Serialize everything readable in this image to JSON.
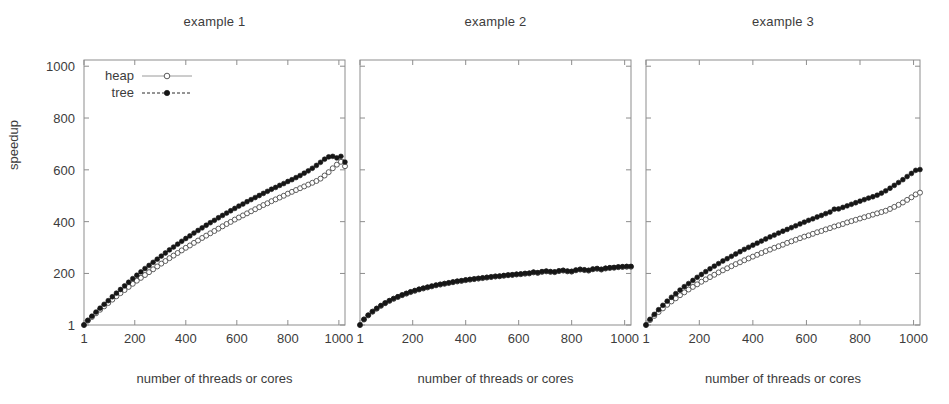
{
  "figure": {
    "ylabel": "speedup",
    "legend": [
      {
        "label": "heap",
        "marker": "open-circle",
        "line": "solid",
        "color": "#4a4a4a"
      },
      {
        "label": "tree",
        "marker": "filled-circle",
        "line": "dashed",
        "color": "#161616"
      }
    ]
  },
  "panels": [
    {
      "title": "example 1",
      "xlabel": "number of threads or cores"
    },
    {
      "title": "example 2",
      "xlabel": "number of threads or cores"
    },
    {
      "title": "example 3",
      "xlabel": "number of threads or cores"
    }
  ],
  "axis": {
    "xticks": [
      "1",
      "200",
      "400",
      "600",
      "800",
      "1000"
    ],
    "xtick_values": [
      1,
      200,
      400,
      600,
      800,
      1000
    ],
    "yticks": [
      "1",
      "200",
      "400",
      "600",
      "800",
      "1000"
    ],
    "ytick_values": [
      1,
      200,
      400,
      600,
      800,
      1000
    ],
    "xlim": [
      1,
      1024
    ],
    "ylim": [
      1,
      1024
    ]
  },
  "chart_data": [
    {
      "type": "line",
      "title": "example 1",
      "xlabel": "number of threads or cores",
      "ylabel": "speedup",
      "xlim": [
        1,
        1024
      ],
      "ylim": [
        1,
        1024
      ],
      "grid": false,
      "legend_position": "top-left",
      "x": [
        1,
        16,
        32,
        48,
        64,
        80,
        96,
        112,
        128,
        144,
        160,
        176,
        192,
        208,
        224,
        240,
        256,
        272,
        288,
        304,
        320,
        336,
        352,
        368,
        384,
        400,
        416,
        432,
        448,
        464,
        480,
        496,
        512,
        528,
        544,
        560,
        576,
        592,
        608,
        624,
        640,
        656,
        672,
        688,
        704,
        720,
        736,
        752,
        768,
        784,
        800,
        816,
        832,
        848,
        864,
        880,
        896,
        912,
        928,
        944,
        960,
        976,
        992,
        1008,
        1024
      ],
      "series": [
        {
          "name": "heap",
          "marker": "open-circle",
          "line": "solid",
          "values": [
            1,
            18,
            32,
            46,
            60,
            73,
            86,
            99,
            112,
            124,
            136,
            148,
            160,
            172,
            183,
            194,
            205,
            216,
            227,
            238,
            248,
            259,
            269,
            279,
            289,
            299,
            308,
            318,
            327,
            337,
            346,
            355,
            364,
            373,
            382,
            391,
            399,
            408,
            416,
            424,
            432,
            440,
            448,
            456,
            464,
            471,
            479,
            486,
            493,
            500,
            508,
            515,
            522,
            529,
            536,
            543,
            550,
            557,
            566,
            578,
            591,
            606,
            620,
            631,
            614
          ]
        },
        {
          "name": "tree",
          "marker": "filled-circle",
          "line": "dashed",
          "values": [
            1,
            19,
            35,
            51,
            66,
            81,
            95,
            110,
            124,
            138,
            152,
            166,
            180,
            193,
            206,
            219,
            231,
            243,
            255,
            267,
            279,
            291,
            302,
            313,
            324,
            335,
            345,
            356,
            366,
            376,
            386,
            396,
            405,
            415,
            424,
            433,
            442,
            451,
            460,
            468,
            477,
            485,
            493,
            501,
            509,
            517,
            525,
            532,
            540,
            547,
            555,
            562,
            570,
            578,
            587,
            596,
            606,
            617,
            629,
            641,
            650,
            652,
            646,
            652,
            630
          ]
        }
      ]
    },
    {
      "type": "line",
      "title": "example 2",
      "xlabel": "number of threads or cores",
      "ylabel": "speedup",
      "xlim": [
        1,
        1024
      ],
      "ylim": [
        1,
        1024
      ],
      "grid": false,
      "legend_position": "none",
      "x": [
        1,
        16,
        32,
        48,
        64,
        80,
        96,
        112,
        128,
        144,
        160,
        176,
        192,
        208,
        224,
        240,
        256,
        272,
        288,
        304,
        320,
        336,
        352,
        368,
        384,
        400,
        416,
        432,
        448,
        464,
        480,
        496,
        512,
        528,
        544,
        560,
        576,
        592,
        608,
        624,
        640,
        656,
        672,
        688,
        704,
        720,
        736,
        752,
        768,
        784,
        800,
        816,
        832,
        848,
        864,
        880,
        896,
        912,
        928,
        944,
        960,
        976,
        992,
        1008,
        1024
      ],
      "series": [
        {
          "name": "heap",
          "marker": "open-circle",
          "line": "solid",
          "values": [
            1,
            22,
            38,
            52,
            64,
            75,
            85,
            94,
            102,
            109,
            116,
            122,
            128,
            133,
            138,
            142,
            146,
            150,
            154,
            157,
            160,
            163,
            166,
            169,
            171,
            174,
            176,
            178,
            180,
            182,
            184,
            186,
            188,
            189,
            191,
            193,
            194,
            196,
            197,
            199,
            200,
            204,
            202,
            206,
            208,
            206,
            205,
            209,
            211,
            208,
            207,
            212,
            215,
            213,
            211,
            216,
            218,
            215,
            219,
            221,
            222,
            224,
            225,
            226,
            226
          ]
        },
        {
          "name": "tree",
          "marker": "filled-circle",
          "line": "dashed",
          "values": [
            1,
            23,
            39,
            53,
            65,
            76,
            86,
            95,
            103,
            110,
            117,
            123,
            129,
            134,
            139,
            143,
            147,
            151,
            155,
            158,
            161,
            164,
            167,
            170,
            172,
            175,
            177,
            179,
            181,
            183,
            185,
            187,
            189,
            190,
            192,
            194,
            195,
            197,
            198,
            200,
            201,
            205,
            203,
            207,
            209,
            207,
            206,
            210,
            212,
            209,
            208,
            213,
            216,
            214,
            212,
            217,
            219,
            216,
            220,
            222,
            223,
            225,
            226,
            227,
            227
          ]
        }
      ]
    },
    {
      "type": "line",
      "title": "example 3",
      "xlabel": "number of threads or cores",
      "ylabel": "speedup",
      "xlim": [
        1,
        1024
      ],
      "ylim": [
        1,
        1024
      ],
      "grid": false,
      "legend_position": "none",
      "x": [
        1,
        16,
        32,
        48,
        64,
        80,
        96,
        112,
        128,
        144,
        160,
        176,
        192,
        208,
        224,
        240,
        256,
        272,
        288,
        304,
        320,
        336,
        352,
        368,
        384,
        400,
        416,
        432,
        448,
        464,
        480,
        496,
        512,
        528,
        544,
        560,
        576,
        592,
        608,
        624,
        640,
        656,
        672,
        688,
        704,
        720,
        736,
        752,
        768,
        784,
        800,
        816,
        832,
        848,
        864,
        880,
        896,
        912,
        928,
        944,
        960,
        976,
        992,
        1008,
        1024
      ],
      "series": [
        {
          "name": "heap",
          "marker": "open-circle",
          "line": "solid",
          "values": [
            1,
            20,
            36,
            51,
            65,
            79,
            92,
            104,
            116,
            127,
            138,
            148,
            158,
            168,
            177,
            186,
            195,
            204,
            212,
            220,
            228,
            236,
            243,
            251,
            258,
            265,
            272,
            279,
            286,
            292,
            299,
            305,
            311,
            318,
            324,
            330,
            336,
            342,
            347,
            353,
            359,
            364,
            370,
            375,
            381,
            386,
            391,
            397,
            402,
            407,
            412,
            417,
            422,
            427,
            432,
            437,
            442,
            449,
            457,
            465,
            474,
            484,
            494,
            505,
            512
          ]
        },
        {
          "name": "tree",
          "marker": "filled-circle",
          "line": "dashed",
          "values": [
            1,
            23,
            42,
            60,
            77,
            93,
            108,
            122,
            136,
            149,
            161,
            173,
            185,
            196,
            207,
            218,
            228,
            238,
            248,
            257,
            266,
            275,
            284,
            293,
            301,
            309,
            317,
            325,
            333,
            341,
            348,
            356,
            363,
            370,
            377,
            384,
            391,
            398,
            405,
            411,
            418,
            424,
            431,
            437,
            448,
            449,
            455,
            461,
            467,
            473,
            479,
            485,
            491,
            496,
            502,
            510,
            519,
            529,
            540,
            551,
            562,
            574,
            586,
            598,
            601
          ]
        }
      ]
    }
  ]
}
